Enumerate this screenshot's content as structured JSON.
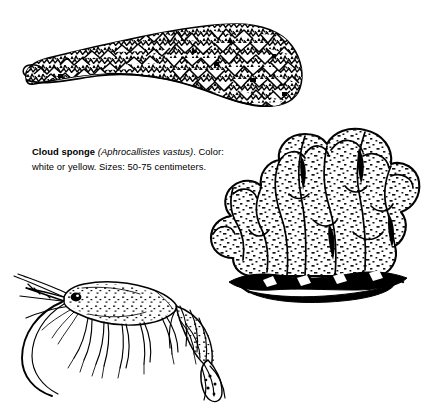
{
  "page": {
    "background_color": "#ffffff",
    "ink_color": "#000000",
    "width": 434,
    "height": 409,
    "style": "black-and-white line illustration plate"
  },
  "caption": {
    "common_name": "Cloud sponge",
    "scientific_name": "(Aphrocallistes vastus)",
    "punctuation_after_name": ".",
    "color_label": "Color:",
    "color_value": "white or yellow.",
    "size_label": "Sizes:",
    "size_value": "50-75 centimeters.",
    "full_text": "Cloud sponge (Aphrocallistes vastus). Color: white or yellow. Sizes: 50-75 centimeters."
  },
  "figures": [
    {
      "id": "crusty-sponge",
      "name": "crusty-elongated-sponge-illustration",
      "description": "Elongated encrusting sponge form with rough nodular surface, tapering to the left and thickening into a clustered mass at the right",
      "position": {
        "x": 18,
        "y": 14,
        "width": 290,
        "height": 100
      }
    },
    {
      "id": "cloud-sponge",
      "name": "cloud-sponge-illustration",
      "description": "Lobed cloud sponge with bulbous rounded lobes, stippled surface texture, resting on a dark rocky substrate",
      "position": {
        "x": 195,
        "y": 122,
        "width": 230,
        "height": 185
      }
    },
    {
      "id": "shrimp",
      "name": "shrimp-illustration",
      "description": "Side view of a shrimp with long sweeping antennae, segmented abdomen, walking legs and a tapered tail",
      "position": {
        "x": 6,
        "y": 272,
        "width": 225,
        "height": 130
      }
    }
  ],
  "icon_names": [
    "crusty-sponge-icon",
    "cloud-sponge-icon",
    "shrimp-icon",
    "rock-substrate-icon"
  ]
}
